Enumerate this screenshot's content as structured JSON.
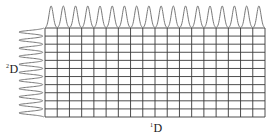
{
  "diagram": {
    "type": "2D spectrum grid with projected peak traces",
    "grid": {
      "columns": 18,
      "rows": 11,
      "left": 45,
      "top": 28,
      "right": 265,
      "bottom": 117,
      "line_color": "#3a3a3a"
    },
    "top_trace": {
      "peaks": 18,
      "baseline_y": 28,
      "peak_height": 22,
      "color": "#777777"
    },
    "left_trace": {
      "peaks": 11,
      "baseline_x": 45,
      "peak_extent": 26,
      "color": "#777777"
    },
    "labels": {
      "x_axis": {
        "superscript": "1",
        "text": "D"
      },
      "y_axis": {
        "superscript": "2",
        "text": "D"
      }
    }
  }
}
